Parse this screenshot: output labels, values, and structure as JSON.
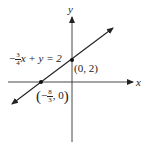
{
  "diagram": {
    "type": "coordinate-graph",
    "axes": {
      "x_label": "x",
      "y_label": "y"
    },
    "line": {
      "equation_prefix": "−",
      "coef_num": "3",
      "coef_den": "4",
      "equation_rest": "x + y = 2"
    },
    "points": [
      {
        "label": "(0, 2)",
        "x": 0,
        "y": 2
      },
      {
        "label_prefix": "−",
        "num": "8",
        "den": "3",
        "label_suffix": ", 0",
        "x": -2.6667,
        "y": 0
      }
    ],
    "colors": {
      "ink": "#222222"
    }
  }
}
